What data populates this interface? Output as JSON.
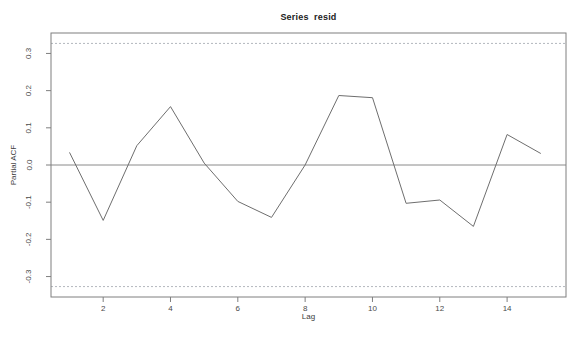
{
  "figure": {
    "title": "Series  resid",
    "xlabel": "Lag",
    "ylabel": "Partial ACF"
  },
  "colors": {
    "background": "#ffffff",
    "data_line": "#6e6e6e",
    "zero_line": "#8a8a8a",
    "frame": "#7f7f7f",
    "ci_line": "#b3b7bd",
    "title_text": "#222222",
    "tick_text": "#4a4a4a"
  },
  "chart_data": {
    "type": "line",
    "title": "Series  resid",
    "xlabel": "Lag",
    "ylabel": "Partial ACF",
    "series_name": "Partial autocorrelations of resid",
    "x": [
      1,
      2,
      3,
      4,
      5,
      6,
      7,
      8,
      9,
      10,
      11,
      12,
      13,
      14,
      15
    ],
    "values": [
      0.034,
      -0.149,
      0.052,
      0.157,
      0.005,
      -0.098,
      -0.141,
      0.0,
      0.187,
      0.181,
      -0.103,
      -0.094,
      -0.165,
      0.082,
      0.031
    ],
    "zero_line": 0,
    "confidence_bounds": {
      "upper": 0.327,
      "lower": -0.327,
      "style": "dashed"
    },
    "xlim": [
      0.45,
      15.75
    ],
    "ylim": [
      -0.355,
      0.355
    ],
    "xticks": [
      2,
      4,
      6,
      8,
      10,
      12,
      14
    ],
    "yticks": [
      -0.3,
      -0.2,
      -0.1,
      0,
      0.1,
      0.2,
      0.3
    ],
    "grid": false,
    "legend": null
  }
}
